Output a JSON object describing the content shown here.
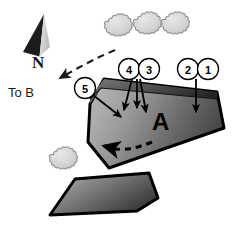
{
  "figure": {
    "background_color": "#ffffff"
  },
  "north_arrow": {
    "label": "N",
    "dark_color": "#1a1a1a",
    "light_color": "#d9d9d9"
  },
  "direction_note": {
    "label": "To B",
    "arrow_style": "dashed",
    "arrow_color": "#1a1a1a"
  },
  "callouts": [
    {
      "id": "callout-5",
      "number": "5",
      "cx": 85,
      "cy": 88
    },
    {
      "id": "callout-4",
      "number": "4",
      "cx": 129,
      "cy": 69
    },
    {
      "id": "callout-3",
      "number": "3",
      "cx": 149,
      "cy": 69
    },
    {
      "id": "callout-2",
      "number": "2",
      "cx": 188,
      "cy": 69
    },
    {
      "id": "callout-1",
      "number": "1",
      "cx": 208,
      "cy": 69
    }
  ],
  "blocks": [
    {
      "id": "block-a",
      "label": "A",
      "label_x": 152,
      "label_y": 130,
      "fill_light": "#b3b3b3",
      "fill_dark": "#4d4d4d",
      "stroke": "#000000"
    },
    {
      "id": "block-lower",
      "label": "",
      "fill_light": "#a6a6a6",
      "fill_dark": "#4a4a4a",
      "stroke": "#000000"
    }
  ],
  "scarp": {
    "id": "scarp-band",
    "fill_light": "#6e6e6e",
    "fill_dark": "#2b2b2b"
  },
  "movement_arrow": {
    "id": "movement-arrow",
    "style": "dashed",
    "direction": "left",
    "color": "#000000"
  },
  "vegetation": [
    {
      "id": "bush-1",
      "cx": 117,
      "cy": 25,
      "r": 11
    },
    {
      "id": "bush-2",
      "cx": 146,
      "cy": 23,
      "r": 11
    },
    {
      "id": "bush-3",
      "cx": 174,
      "cy": 23,
      "r": 11
    },
    {
      "id": "bush-4",
      "cx": 62,
      "cy": 158,
      "r": 11
    }
  ],
  "vegetation_style": {
    "fill": "#d4d4d4",
    "stroke": "#8a8a8a"
  }
}
